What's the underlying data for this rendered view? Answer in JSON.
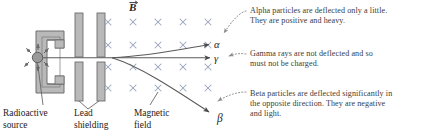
{
  "diagram": {
    "field_label": "B",
    "field_label_note": "vector-arrow-over-B"
  },
  "particle_labels": {
    "alpha": "α",
    "gamma": "γ",
    "beta": "β"
  },
  "annotations": {
    "alpha": "Alpha particles are deflected only a little.\nThey are positive and heavy.",
    "gamma": "Gamma rays are not deflected and so\nmust not be charged.",
    "beta": "Beta particles are deflected significantly in\nthe opposite direction. They are negative\nand light."
  },
  "captions": {
    "source": "Radioactive\nsource",
    "lead": "Lead\nshielding",
    "field": "Magnetic\nfield"
  },
  "field_grid": {
    "symbol": "×",
    "columns": 5,
    "rows": 4,
    "x_positions": [
      108,
      133,
      158,
      183,
      208
    ],
    "y_positions": [
      22,
      45,
      67,
      88
    ],
    "color": "#9aa7bd"
  },
  "colors": {
    "lead_fill": "#b9b9b9",
    "lead_stroke": "#6e6e6e",
    "source_fill": "#9a9a9a",
    "source_stroke": "#555555",
    "path_stroke": "#5a5a5a",
    "leader_stroke": "#8d8d8d",
    "text": "#3b3b3b",
    "caption_text": "#1c1c1c",
    "background": "#ffffff"
  }
}
